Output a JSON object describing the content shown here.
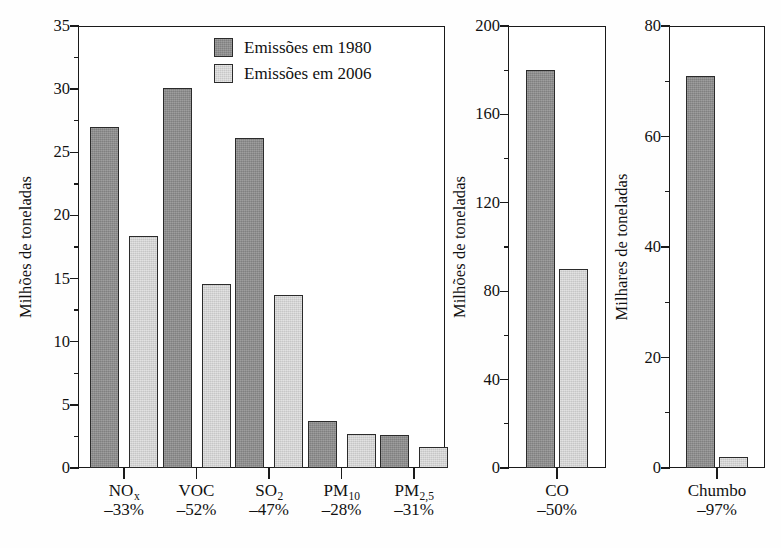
{
  "chart_data": [
    {
      "type": "bar",
      "panel": "left",
      "title": "",
      "xlabel": "",
      "ylabel": "Milhões de toneladas",
      "ylim": [
        0,
        35
      ],
      "yticks": [
        0,
        5,
        10,
        15,
        20,
        25,
        30,
        35
      ],
      "ytick_labels": [
        "0",
        "5",
        "10",
        "15",
        "20",
        "25",
        "30",
        "35"
      ],
      "minor_tick_step": 2.5,
      "grid": false,
      "categories": [
        "NOx",
        "VOC",
        "SO2",
        "PM10",
        "PM2,5"
      ],
      "category_labels": [
        {
          "base": "NO",
          "sub": "x",
          "change": "–33%"
        },
        {
          "base": "VOC",
          "sub": "",
          "change": "–52%"
        },
        {
          "base": "SO",
          "sub": "2",
          "change": "–47%"
        },
        {
          "base": "PM",
          "sub": "10",
          "change": "–28%"
        },
        {
          "base": "PM",
          "sub": "2,5",
          "change": "–31%"
        }
      ],
      "series": [
        {
          "name": "Emissões em 1980",
          "color": "#8d8d8d",
          "values": [
            27.0,
            30.1,
            26.1,
            3.7,
            2.6
          ]
        },
        {
          "name": "Emissões em 2006",
          "color": "#d4d4d4",
          "values": [
            18.4,
            14.6,
            13.7,
            2.7,
            1.7
          ]
        }
      ],
      "legend": {
        "position": "top-right-inside",
        "entries": [
          {
            "label": "Emissões em 1980",
            "swatch": "dark"
          },
          {
            "label": "Emissões em 2006",
            "swatch": "light"
          }
        ]
      }
    },
    {
      "type": "bar",
      "panel": "middle",
      "title": "",
      "xlabel": "",
      "ylabel": "Milhões de toneladas",
      "ylim": [
        0,
        200
      ],
      "yticks": [
        0,
        40,
        80,
        120,
        160,
        200
      ],
      "ytick_labels": [
        "0",
        "40",
        "80",
        "120",
        "160",
        "200"
      ],
      "minor_tick_step": 20,
      "grid": false,
      "categories": [
        "CO"
      ],
      "category_labels": [
        {
          "base": "CO",
          "sub": "",
          "change": "–50%"
        }
      ],
      "series": [
        {
          "name": "Emissões em 1980",
          "color": "#8d8d8d",
          "values": [
            180
          ]
        },
        {
          "name": "Emissões em 2006",
          "color": "#d4d4d4",
          "values": [
            90
          ]
        }
      ]
    },
    {
      "type": "bar",
      "panel": "right",
      "title": "",
      "xlabel": "",
      "ylabel": "Milhares de toneladas",
      "ylim": [
        0,
        80
      ],
      "yticks": [
        0,
        20,
        40,
        60,
        80
      ],
      "ytick_labels": [
        "0",
        "20",
        "40",
        "60",
        "80"
      ],
      "minor_tick_step": 10,
      "grid": false,
      "categories": [
        "Chumbo"
      ],
      "category_labels": [
        {
          "base": "Chumbo",
          "sub": "",
          "change": "–97%"
        }
      ],
      "series": [
        {
          "name": "Emissões em 1980",
          "color": "#8d8d8d",
          "values": [
            71
          ]
        },
        {
          "name": "Emissões em 2006",
          "color": "#d4d4d4",
          "values": [
            2
          ]
        }
      ]
    }
  ],
  "colors": {
    "series_1980": "#8d8d8d",
    "series_2006": "#d4d4d4",
    "axis": "#1a1a1a",
    "background": "#fefefe"
  }
}
